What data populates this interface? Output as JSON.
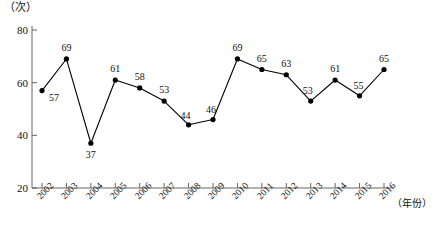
{
  "chart_data": {
    "type": "line",
    "title": "",
    "xlabel": "（年份）",
    "ylabel": "（次）",
    "categories": [
      "2002",
      "2003",
      "2004",
      "2005",
      "2006",
      "2007",
      "2008",
      "2009",
      "2010",
      "2011",
      "2012",
      "2013",
      "2014",
      "2015",
      "2016"
    ],
    "values": [
      57,
      69,
      37,
      61,
      58,
      53,
      44,
      46,
      69,
      65,
      63,
      53,
      61,
      55,
      65
    ],
    "ylim": [
      20,
      80
    ],
    "yticks": [
      20,
      40,
      60,
      80
    ],
    "grid": false,
    "legend": null,
    "marker": "filled-circle",
    "series_color": "#000000",
    "data_labels_shown": true
  },
  "axes": {
    "y_unit_label": "（次）",
    "x_unit_label": "（年份）",
    "y_tick_labels": [
      "80",
      "60",
      "40",
      "20"
    ],
    "x_tick_labels": [
      "2002",
      "2003",
      "2004",
      "2005",
      "2006",
      "2007",
      "2008",
      "2009",
      "2010",
      "2011",
      "2012",
      "2013",
      "2014",
      "2015",
      "2016"
    ]
  },
  "data_labels": [
    "57",
    "69",
    "37",
    "61",
    "58",
    "53",
    "44",
    "46",
    "69",
    "65",
    "63",
    "53",
    "61",
    "55",
    "65"
  ],
  "caption": "",
  "colors": {
    "axis": "#555555",
    "line": "#000000",
    "marker": "#000000",
    "text": "#111111",
    "background": "#ffffff"
  }
}
